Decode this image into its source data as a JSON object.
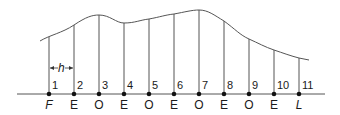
{
  "diagram": {
    "type": "ordinates-under-curve",
    "spacing_label": "h",
    "ordinates": [
      {
        "number": "1",
        "label": "F",
        "italic": true,
        "x": 49,
        "top": 37
      },
      {
        "number": "2",
        "label": "E",
        "italic": false,
        "x": 74,
        "top": 25
      },
      {
        "number": "3",
        "label": "O",
        "italic": false,
        "x": 99,
        "top": 15
      },
      {
        "number": "4",
        "label": "E",
        "italic": false,
        "x": 124,
        "top": 23
      },
      {
        "number": "5",
        "label": "O",
        "italic": false,
        "x": 149,
        "top": 19
      },
      {
        "number": "6",
        "label": "E",
        "italic": false,
        "x": 174,
        "top": 14
      },
      {
        "number": "7",
        "label": "O",
        "italic": false,
        "x": 199,
        "top": 10
      },
      {
        "number": "8",
        "label": "E",
        "italic": false,
        "x": 224,
        "top": 21
      },
      {
        "number": "9",
        "label": "O",
        "italic": false,
        "x": 249,
        "top": 39
      },
      {
        "number": "10",
        "label": "E",
        "italic": false,
        "x": 274,
        "top": 50
      },
      {
        "number": "11",
        "label": "L",
        "italic": true,
        "x": 299,
        "top": 58
      }
    ],
    "baseline_y": 94,
    "colors": {
      "line": "#555555",
      "text": "#1a1a1a",
      "dot": "#111111"
    }
  }
}
